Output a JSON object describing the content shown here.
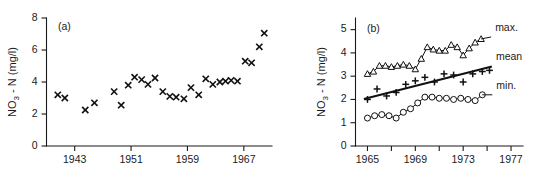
{
  "figure": {
    "background": "#ffffff",
    "ink_color": "#111111"
  },
  "chart_data": [
    {
      "type": "scatter",
      "panel_label": "(a)",
      "title": "",
      "xlabel": "",
      "ylabel": "NO3 - N (mg/l)",
      "ylabel_base": "NO",
      "ylabel_sub": "3",
      "ylabel_rest": " - N (mg/l)",
      "xlim": [
        1939,
        1971
      ],
      "ylim": [
        0,
        8
      ],
      "xticks": [
        1943,
        1951,
        1959,
        1967
      ],
      "xtick_labels": [
        "1943",
        "1951",
        "1959",
        "1967"
      ],
      "yticks": [
        0,
        2,
        4,
        6,
        8
      ],
      "ytick_labels": [
        "0",
        "2",
        "4",
        "6",
        "8"
      ],
      "grid": false,
      "legend": "none",
      "marker": "x",
      "series": [
        {
          "name": "annual mean NO3-N",
          "marker": "x",
          "x": [
            1940.6,
            1941.6,
            1944.5,
            1945.8,
            1948.6,
            1949.6,
            1950.6,
            1951.5,
            1952.5,
            1953.4,
            1954.4,
            1955.5,
            1956.5,
            1957.4,
            1958.5,
            1959.5,
            1960.6,
            1961.6,
            1962.6,
            1963.6,
            1964.4,
            1965.2,
            1966.1,
            1967.2,
            1968.1,
            1969.2,
            1969.9
          ],
          "y": [
            3.2,
            3.0,
            2.25,
            2.7,
            3.4,
            2.55,
            3.8,
            4.3,
            4.15,
            3.85,
            4.25,
            3.4,
            3.1,
            3.05,
            2.95,
            3.65,
            3.2,
            4.2,
            3.85,
            4.0,
            4.05,
            4.1,
            4.05,
            5.3,
            5.2,
            6.2,
            7.05
          ]
        }
      ]
    },
    {
      "type": "line",
      "panel_label": "(b)",
      "title": "",
      "xlabel": "",
      "ylabel": "NO3 - N (mg/l)",
      "ylabel_base": "NO",
      "ylabel_sub": "3",
      "ylabel_rest": " - N (mg/l)",
      "xlim": [
        1964,
        1978
      ],
      "ylim": [
        0,
        5.5
      ],
      "xticks": [
        1965,
        1967,
        1969,
        1971,
        1973,
        1975,
        1977
      ],
      "xtick_labels": [
        "1965",
        "",
        "1969",
        "",
        "1973",
        "",
        "1977"
      ],
      "xticks_labeled": [
        1965,
        1969,
        1973,
        1977
      ],
      "yticks": [
        0,
        1,
        2,
        3,
        4,
        5
      ],
      "ytick_labels": [
        "0",
        "1",
        "2",
        "3",
        "4",
        "5"
      ],
      "grid": false,
      "legend": "right-inline",
      "series": [
        {
          "name": "max.",
          "label": "max.",
          "marker": "triangle-open",
          "x": [
            1965,
            1965.5,
            1966,
            1966.5,
            1967,
            1967.5,
            1968,
            1968.5,
            1969,
            1969.5,
            1970,
            1970.5,
            1971,
            1971.5,
            1972,
            1972.5,
            1973,
            1973.5,
            1974,
            1974.5
          ],
          "y": [
            3.1,
            3.2,
            3.45,
            3.45,
            3.4,
            3.45,
            3.5,
            3.45,
            3.3,
            3.75,
            4.25,
            4.15,
            4.1,
            4.1,
            4.35,
            4.25,
            3.9,
            4.2,
            4.45,
            4.6
          ]
        },
        {
          "name": "mean",
          "label": "mean",
          "marker": "plus",
          "trend": true,
          "trend_endpoints": [
            [
              1964.7,
              2.02
            ],
            [
              1975.4,
              3.42
            ]
          ],
          "x": [
            1965,
            1965.8,
            1966.6,
            1967.4,
            1968.2,
            1969,
            1969.8,
            1970.6,
            1971.4,
            1972.2,
            1973,
            1973.8,
            1974.6,
            1975.2
          ],
          "y": [
            2.0,
            2.45,
            2.15,
            2.3,
            2.65,
            2.8,
            2.95,
            2.75,
            3.1,
            3.05,
            2.75,
            3.1,
            3.2,
            3.25
          ]
        },
        {
          "name": "min.",
          "label": "min.",
          "marker": "circle-open",
          "x": [
            1965,
            1965.6,
            1966.2,
            1966.8,
            1967.4,
            1968,
            1968.6,
            1969.2,
            1969.8,
            1970.4,
            1971,
            1971.6,
            1972.2,
            1972.8,
            1973.4,
            1974,
            1974.6
          ],
          "y": [
            1.2,
            1.3,
            1.35,
            1.3,
            1.2,
            1.45,
            1.6,
            1.85,
            2.1,
            2.1,
            2.05,
            2.05,
            2.0,
            2.05,
            2.0,
            1.95,
            2.2
          ]
        }
      ]
    }
  ]
}
